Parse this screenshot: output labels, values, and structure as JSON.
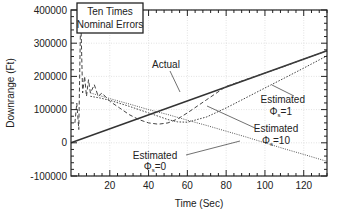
{
  "chart_data": {
    "type": "line",
    "title": "",
    "xlabel": "Time (Sec)",
    "ylabel": "Downrange (Ft)",
    "xlim": [
      0,
      132
    ],
    "ylim": [
      -100000,
      400000
    ],
    "x_ticks": [
      20,
      40,
      60,
      80,
      100,
      120
    ],
    "y_ticks": [
      -100000,
      0,
      100000,
      200000,
      300000,
      400000
    ],
    "y_tick_labels": [
      "-100000",
      "0",
      "100000",
      "200000",
      "300000",
      "400000"
    ],
    "grid": true,
    "legend_box": {
      "lines": [
        "Ten Times",
        "Nominal Errors"
      ]
    },
    "series": [
      {
        "name": "Actual",
        "style": "solid",
        "x": [
          0,
          132
        ],
        "y": [
          0,
          277000
        ]
      },
      {
        "name": "Estimated Φs=10",
        "style": "dashed",
        "x": [
          2,
          3,
          4,
          5,
          6,
          7,
          8,
          9,
          10,
          12,
          14,
          16,
          20,
          25,
          30,
          35,
          40,
          45,
          50,
          55,
          60,
          70,
          80,
          90,
          100,
          110,
          120,
          132
        ],
        "y": [
          60000,
          120000,
          40000,
          390000,
          150000,
          200000,
          140000,
          190000,
          150000,
          175000,
          140000,
          150000,
          125000,
          105000,
          85000,
          70000,
          60000,
          56000,
          60000,
          72000,
          90000,
          130000,
          170000,
          190000,
          210000,
          230000,
          252000,
          277000
        ]
      },
      {
        "name": "Estimated Φs=1",
        "style": "dotted-fine",
        "x": [
          10,
          15,
          20,
          30,
          40,
          50,
          55,
          60,
          70,
          80,
          90,
          100,
          110,
          120,
          132
        ],
        "y": [
          140000,
          135000,
          128000,
          110000,
          90000,
          70000,
          63000,
          62000,
          78000,
          105000,
          135000,
          165000,
          195000,
          225000,
          262000
        ]
      },
      {
        "name": "Estimated Φs=0",
        "style": "dotted",
        "x": [
          10,
          15,
          20,
          30,
          40,
          50,
          60,
          70,
          80,
          90,
          100,
          110,
          120,
          132
        ],
        "y": [
          150000,
          142000,
          133000,
          117000,
          100000,
          85000,
          68000,
          52000,
          35000,
          18000,
          0,
          -18000,
          -35000,
          -56000
        ]
      }
    ],
    "annotations": [
      {
        "text": "Actual",
        "at": [
          68,
          290000
        ],
        "arrow_to": [
          88,
          185000
        ]
      },
      {
        "text": [
          "Estimated",
          "Φs=1"
        ],
        "at": [
          118,
          80000
        ],
        "arrow_to": [
          104,
          175000
        ]
      },
      {
        "text": [
          "Estimated",
          "Φs=10"
        ],
        "at": [
          113,
          25000
        ],
        "arrow_to": [
          70,
          110000
        ]
      },
      {
        "text": [
          "Estimated",
          "Φs=0"
        ],
        "at": [
          49,
          -45000
        ],
        "arrow_to": [
          84,
          22000
        ]
      }
    ]
  },
  "labels": {
    "legend_line1": "Ten Times",
    "legend_line2": "Nominal Errors",
    "xlabel": "Time (Sec)",
    "ylabel": "Downrange (Ft)",
    "actual": "Actual",
    "est": "Estimated",
    "phi1": "=1",
    "phi10": "=10",
    "phi0": "=0",
    "phi_symbol": "Φ",
    "phi_sub": "s"
  }
}
